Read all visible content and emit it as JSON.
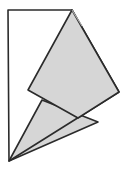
{
  "figure": {
    "title": "Overlapping polygon geometry figure",
    "canvas": {
      "width": 128,
      "height": 170
    },
    "colors": {
      "background": "#ffffff",
      "fill_gray": "#d6d6d6",
      "stroke_dark": "#2b2b2b",
      "stroke_light": "#b0b0b0"
    },
    "stroke_width": 1.6,
    "shapes": [
      {
        "name": "outline-kite",
        "label": "white outlined kite polygon",
        "fill": "none",
        "stroke": "#2b2b2b",
        "points": "8,10 72,10 119,92 9,161"
      },
      {
        "name": "gray-quadrilateral",
        "label": "shaded quadrilateral folded flap",
        "fill": "#d6d6d6",
        "stroke": "#2b2b2b",
        "points": "72,10 119,92 78,118 28,90"
      },
      {
        "name": "gray-triangle",
        "label": "shaded lower triangle",
        "fill": "#d6d6d6",
        "stroke": "#2b2b2b",
        "points": "42,100 98,122 9,161"
      }
    ],
    "crease_lines": [
      {
        "name": "apex-crease",
        "label": "faint crease line at apex",
        "stroke": "#b0b0b0",
        "x1": 72,
        "y1": 10,
        "x2": 82,
        "y2": 26
      }
    ],
    "vertices": [
      {
        "name": "top-left-corner",
        "x": 8,
        "y": 10
      },
      {
        "name": "apex-top",
        "x": 72,
        "y": 10
      },
      {
        "name": "right-corner",
        "x": 119,
        "y": 92
      },
      {
        "name": "left-fold-corner",
        "x": 28,
        "y": 90
      },
      {
        "name": "notch-vertex",
        "x": 42,
        "y": 100
      },
      {
        "name": "inner-cross-vertex",
        "x": 78,
        "y": 118
      },
      {
        "name": "lower-right-vertex",
        "x": 98,
        "y": 122
      },
      {
        "name": "bottom-point",
        "x": 9,
        "y": 161
      }
    ]
  }
}
